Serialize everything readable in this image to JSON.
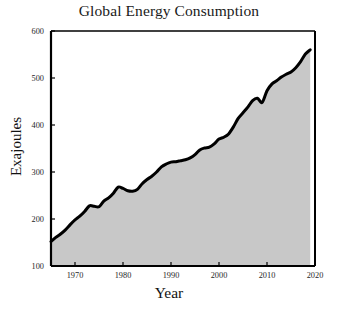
{
  "chart_data": {
    "type": "area",
    "title": "Global Energy Consumption",
    "xlabel": "Year",
    "ylabel": "Exajoules",
    "xlim": [
      1965,
      2020
    ],
    "ylim": [
      100,
      600
    ],
    "xticks": [
      1970,
      1980,
      1990,
      2000,
      2010,
      2020
    ],
    "xtick_labels": [
      "1970",
      "1980",
      "1990",
      "2000",
      "2010",
      "2020"
    ],
    "yticks": [
      100,
      200,
      300,
      400,
      500,
      600
    ],
    "ytick_labels": [
      "100",
      "200",
      "300",
      "400",
      "500",
      "600"
    ],
    "grid": false,
    "legend": null,
    "line_color": "#000000",
    "fill_color": "#c8c8c8",
    "axis_color": "#000000",
    "background_color": "#ffffff",
    "line_width": 3,
    "x": [
      1965,
      1966,
      1967,
      1968,
      1969,
      1970,
      1971,
      1972,
      1973,
      1974,
      1975,
      1976,
      1977,
      1978,
      1979,
      1980,
      1981,
      1982,
      1983,
      1984,
      1985,
      1986,
      1987,
      1988,
      1989,
      1990,
      1991,
      1992,
      1993,
      1994,
      1995,
      1996,
      1997,
      1998,
      1999,
      2000,
      2001,
      2002,
      2003,
      2004,
      2005,
      2006,
      2007,
      2008,
      2009,
      2010,
      2011,
      2012,
      2013,
      2014,
      2015,
      2016,
      2017,
      2018,
      2019
    ],
    "y": [
      152,
      161,
      168,
      177,
      188,
      198,
      206,
      216,
      228,
      227,
      226,
      238,
      245,
      255,
      268,
      265,
      260,
      259,
      263,
      275,
      284,
      291,
      300,
      311,
      317,
      321,
      322,
      324,
      326,
      330,
      337,
      347,
      351,
      353,
      360,
      370,
      374,
      381,
      396,
      414,
      426,
      438,
      452,
      457,
      448,
      473,
      487,
      494,
      502,
      508,
      513,
      522,
      535,
      551,
      560
    ],
    "series_name": "Global primary energy consumption",
    "units": "Exajoules"
  },
  "canvas": {
    "plot_left": 51,
    "plot_right": 315,
    "plot_top": 31,
    "plot_bottom": 266
  }
}
